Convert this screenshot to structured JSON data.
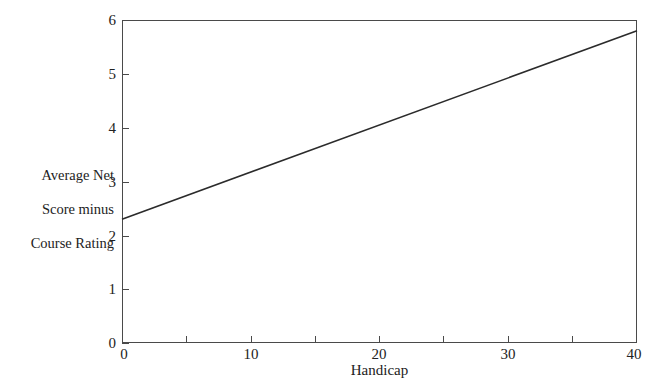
{
  "chart_data": {
    "type": "line",
    "title": "",
    "xlabel": "Handicap",
    "ylabel": "Average Net\nScore minus\nCourse Rating",
    "ylabel_lines": [
      "Average Net",
      "Score minus",
      "Course Rating"
    ],
    "xlim": [
      0,
      40
    ],
    "ylim": [
      0,
      6
    ],
    "grid": false,
    "legend": "none",
    "x_ticks": [
      0,
      10,
      20,
      30,
      40
    ],
    "x_tick_labels": [
      "0",
      "10",
      "20",
      "30",
      "40"
    ],
    "x_minor_ticks": [
      5,
      15,
      25,
      35
    ],
    "y_ticks": [
      0,
      1,
      2,
      3,
      4,
      5,
      6
    ],
    "y_tick_labels": [
      "0",
      "1",
      "2",
      "3",
      "4",
      "5",
      "6"
    ],
    "series": [
      {
        "name": "Average Net Score minus Course Rating",
        "color": "#2b2b2b",
        "x": [
          0,
          40
        ],
        "values": [
          2.3,
          5.8
        ]
      }
    ],
    "x": [
      0,
      40
    ]
  },
  "style": {
    "background": "#ffffff",
    "axis_color": "#4a4a4a",
    "line_color": "#2b2b2b",
    "text_color": "#222222"
  }
}
